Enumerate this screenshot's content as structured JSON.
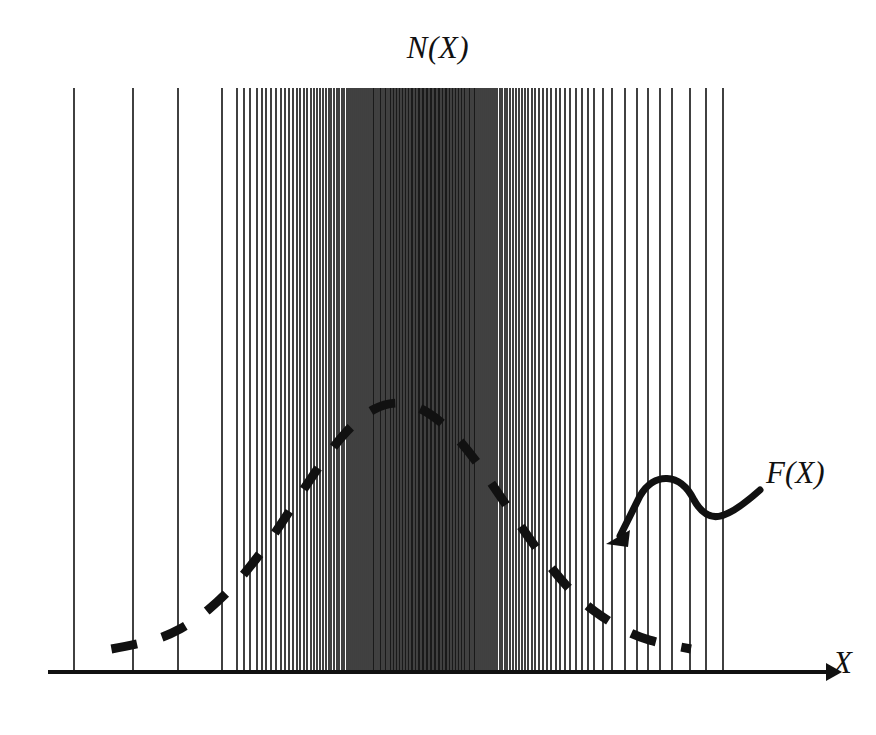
{
  "figure": {
    "title": "N(X)",
    "curve_label": "F(X)",
    "axis_label_x": "X",
    "ink_color": "#111111",
    "background_color": "#ffffff"
  },
  "chart_data": {
    "type": "line",
    "title": "N(X)",
    "xlabel": "X",
    "ylabel": "",
    "grid": false,
    "legend": "none",
    "annotations": [
      {
        "text": "F(X)",
        "kind": "curve-callout",
        "arrow_from_x": 760,
        "arrow_from_y": 490,
        "arrow_to_x": 606,
        "arrow_to_y": 544
      },
      {
        "text": "N(X)",
        "kind": "plot-title"
      },
      {
        "text": "X",
        "kind": "axis-arrow-label"
      }
    ],
    "axis": {
      "x_start": 48,
      "x_end": 828,
      "baseline_y": 672,
      "arrowhead": true,
      "xlim": [
        0,
        1
      ],
      "ylim": [
        0,
        1
      ]
    },
    "series": [
      {
        "name": "F(X)",
        "style": "dashed",
        "description": "Gaussian envelope density curve drawn as thick dashes",
        "x": [
          0.06,
          0.1,
          0.14,
          0.18,
          0.22,
          0.26,
          0.3,
          0.34,
          0.38,
          0.42,
          0.46,
          0.5,
          0.54,
          0.58,
          0.62,
          0.66,
          0.7,
          0.74,
          0.78,
          0.82,
          0.86,
          0.9
        ],
        "y": [
          0.02,
          0.04,
          0.07,
          0.13,
          0.22,
          0.34,
          0.49,
          0.66,
          0.82,
          0.94,
          1.0,
          0.99,
          0.92,
          0.8,
          0.64,
          0.48,
          0.33,
          0.21,
          0.13,
          0.07,
          0.04,
          0.02
        ]
      },
      {
        "name": "N(X) samples",
        "style": "vertical-ticks",
        "description": "Individual sample events drawn as full-height vertical lines; density follows F(X)",
        "tick_top_y": 88,
        "tick_bottom_y": 672,
        "count": 172,
        "positions": [
          74,
          133,
          178,
          222,
          237,
          244,
          250,
          257,
          262,
          266,
          271,
          276,
          281,
          285,
          289,
          293,
          297,
          300,
          304,
          307,
          311,
          314,
          317,
          320,
          323,
          326,
          329,
          331,
          334,
          337,
          339,
          342,
          344,
          347,
          349,
          351,
          353,
          355,
          357,
          359,
          361,
          363,
          365,
          367,
          369,
          371,
          373,
          374,
          376,
          378,
          380,
          381,
          383,
          385,
          386,
          388,
          390,
          391,
          393,
          394,
          396,
          397,
          399,
          400,
          402,
          403,
          405,
          406,
          408,
          409,
          411,
          412,
          413,
          415,
          416,
          418,
          419,
          420,
          422,
          423,
          424,
          426,
          427,
          428,
          430,
          431,
          432,
          434,
          435,
          436,
          438,
          439,
          440,
          442,
          443,
          445,
          446,
          447,
          449,
          450,
          452,
          453,
          455,
          456,
          458,
          459,
          461,
          462,
          464,
          465,
          467,
          469,
          470,
          472,
          474,
          475,
          477,
          479,
          481,
          483,
          485,
          487,
          489,
          491,
          493,
          495,
          497,
          500,
          502,
          505,
          507,
          510,
          513,
          516,
          519,
          522,
          525,
          528,
          532,
          535,
          539,
          543,
          547,
          551,
          556,
          560,
          565,
          570,
          576,
          582,
          588,
          594,
          603,
          612,
          625,
          637,
          648,
          660,
          672,
          690,
          706,
          723
        ]
      }
    ]
  }
}
